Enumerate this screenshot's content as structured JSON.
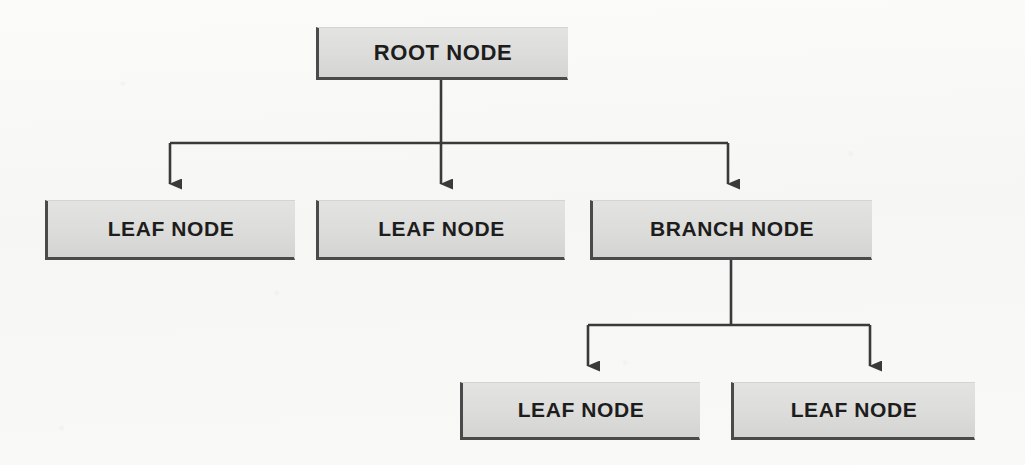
{
  "diagram": {
    "background_color": "#f8f8f6",
    "node_fill_color": "#dcdcda",
    "node_border_color": "#4a4a4a",
    "connector_color": "#3a3a3a",
    "nodes": [
      {
        "id": "root",
        "label": "ROOT NODE",
        "role": "root"
      },
      {
        "id": "leaf1",
        "label": "LEAF NODE",
        "role": "leaf"
      },
      {
        "id": "leaf2",
        "label": "LEAF NODE",
        "role": "leaf"
      },
      {
        "id": "branch",
        "label": "BRANCH NODE",
        "role": "branch"
      },
      {
        "id": "leaf3",
        "label": "LEAF NODE",
        "role": "leaf"
      },
      {
        "id": "leaf4",
        "label": "LEAF NODE",
        "role": "leaf"
      }
    ],
    "edges": [
      {
        "from": "root",
        "to": "leaf1",
        "style": "elbow-arrow"
      },
      {
        "from": "root",
        "to": "leaf2",
        "style": "straight-arrow"
      },
      {
        "from": "root",
        "to": "branch",
        "style": "elbow-arrow"
      },
      {
        "from": "branch",
        "to": "leaf3",
        "style": "elbow-arrow"
      },
      {
        "from": "branch",
        "to": "leaf4",
        "style": "elbow-arrow"
      }
    ]
  }
}
